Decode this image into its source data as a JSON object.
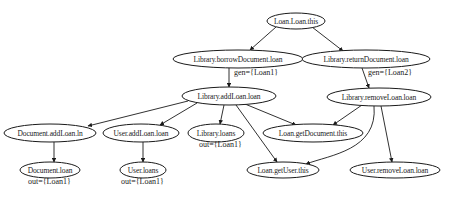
{
  "diagram": {
    "type": "directed-graph",
    "nodes": [
      {
        "id": "loan_this",
        "label": "Loan.Loan.this",
        "cx": 296,
        "cy": 21,
        "rx": 29,
        "ry": 8
      },
      {
        "id": "borrow",
        "label": "Library.borrowDocument.loan",
        "cx": 238,
        "cy": 59,
        "rx": 65,
        "ry": 9
      },
      {
        "id": "return",
        "label": "Library.returnDocument.loan",
        "cx": 366,
        "cy": 59,
        "rx": 64,
        "ry": 9
      },
      {
        "id": "addloan",
        "label": "Library.addLoan.loan",
        "cx": 229,
        "cy": 96,
        "rx": 47,
        "ry": 9
      },
      {
        "id": "removeloan",
        "label": "Library.removeLoan.loan",
        "cx": 379,
        "cy": 97,
        "rx": 52,
        "ry": 9
      },
      {
        "id": "doc_addloan",
        "label": "Document.addLoan.ln",
        "cx": 50,
        "cy": 133,
        "rx": 46,
        "ry": 9
      },
      {
        "id": "user_addloan",
        "label": "User.addLoan.loan",
        "cx": 141,
        "cy": 133,
        "rx": 38,
        "ry": 9
      },
      {
        "id": "lib_loans",
        "label": "Library.loans",
        "cx": 216,
        "cy": 133,
        "rx": 28,
        "ry": 9
      },
      {
        "id": "getdoc",
        "label": "Loan.getDocument.this",
        "cx": 313,
        "cy": 133,
        "rx": 50,
        "ry": 9
      },
      {
        "id": "doc_loan",
        "label": "Document.loan",
        "cx": 50,
        "cy": 170,
        "rx": 30,
        "ry": 8
      },
      {
        "id": "user_loans",
        "label": "User.loans",
        "cx": 143,
        "cy": 170,
        "rx": 23,
        "ry": 8
      },
      {
        "id": "getuser",
        "label": "Loan.getUser.this",
        "cx": 283,
        "cy": 170,
        "rx": 36,
        "ry": 8
      },
      {
        "id": "user_removeloan",
        "label": "User.removeLoan.loan",
        "cx": 395,
        "cy": 170,
        "rx": 45,
        "ry": 8
      }
    ],
    "edges": [
      {
        "from": "loan_this",
        "to": "borrow",
        "path": "M276,27 L250,50"
      },
      {
        "from": "loan_this",
        "to": "return",
        "path": "M312,27 L343,51"
      },
      {
        "from": "borrow",
        "to": "addloan",
        "path": "M229,68 L229,87"
      },
      {
        "from": "return",
        "to": "removeloan",
        "path": "M362,68 L369,88"
      },
      {
        "from": "addloan",
        "to": "doc_addloan",
        "path": "M188,101 L88,126"
      },
      {
        "from": "addloan",
        "to": "user_addloan",
        "path": "M197,103 L160,125"
      },
      {
        "from": "addloan",
        "to": "lib_loans",
        "path": "M224,105 L220,124"
      },
      {
        "from": "addloan",
        "to": "getdoc",
        "path": "M245,104 L296,125"
      },
      {
        "from": "addloan",
        "to": "getuser",
        "path": "M236,105 L277,162"
      },
      {
        "from": "removeloan",
        "to": "getdoc",
        "path": "M362,105 L333,125"
      },
      {
        "from": "removeloan",
        "to": "getuser",
        "path": "M374,106 C378,150 330,155 306,164"
      },
      {
        "from": "removeloan",
        "to": "user_removeloan",
        "path": "M381,106 L392,162"
      },
      {
        "from": "doc_addloan",
        "to": "doc_loan",
        "path": "M54,142 L54,162"
      },
      {
        "from": "user_addloan",
        "to": "user_loans",
        "path": "M143,142 L143,162"
      }
    ],
    "edge_labels": [
      {
        "text": "gen={Loan1}",
        "x": 234,
        "y": 73
      },
      {
        "text": "gen={Loan2}",
        "x": 368,
        "y": 73
      }
    ],
    "node_annotations": [
      {
        "text": "out={Loan1}",
        "x": 199,
        "y": 145
      },
      {
        "text": "out={Loan1}",
        "x": 28,
        "y": 182
      },
      {
        "text": "out={Loan1}",
        "x": 121,
        "y": 182
      }
    ]
  }
}
